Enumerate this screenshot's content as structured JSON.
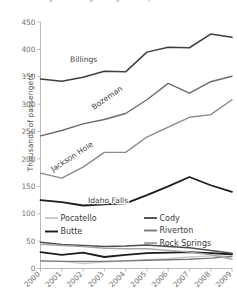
{
  "chart_data": {
    "type": "line",
    "title": "Passenger boardings at regional airports",
    "xlabel": "",
    "ylabel": "Thousands of passengers",
    "ylim": [
      0,
      450
    ],
    "ytick_labels": [
      "0",
      "50",
      "100",
      "150",
      "200",
      "250",
      "300",
      "350",
      "400",
      "450"
    ],
    "ytick_values": [
      0,
      50,
      100,
      150,
      200,
      250,
      300,
      350,
      400,
      450
    ],
    "grid": false,
    "legend_position": "inside-lower-left",
    "categories": [
      "2000",
      "2001",
      "2002",
      "2003",
      "2004",
      "2005",
      "2006",
      "2007",
      "2008",
      "2009"
    ],
    "x": [
      2000,
      2001,
      2002,
      2003,
      2004,
      2005,
      2006,
      2007,
      2008,
      2009
    ],
    "series": [
      {
        "name": "Billings",
        "color": "#3f3f3f",
        "width": 1.5,
        "label_mode": "inline",
        "values": [
          346,
          342,
          349,
          360,
          359,
          395,
          404,
          403,
          428,
          422
        ]
      },
      {
        "name": "Bozeman",
        "color": "#6b6b6b",
        "width": 1.4,
        "label_mode": "inline",
        "values": [
          242,
          252,
          264,
          272,
          283,
          308,
          338,
          320,
          341,
          351
        ]
      },
      {
        "name": "Jackson Hole",
        "color": "#8a8a8a",
        "width": 1.4,
        "label_mode": "inline",
        "values": [
          174,
          165,
          185,
          212,
          212,
          240,
          258,
          276,
          281,
          308
        ]
      },
      {
        "name": "Idaho Falls",
        "color": "#1c1c1c",
        "width": 1.8,
        "label_mode": "inline",
        "values": [
          125,
          121,
          115,
          117,
          119,
          134,
          150,
          167,
          152,
          140
        ]
      },
      {
        "name": "Pocatello",
        "color": "#c9c9c9",
        "width": 1.4,
        "label_mode": "legend",
        "values": [
          13,
          13,
          9,
          12,
          14,
          16,
          18,
          21,
          23,
          26
        ]
      },
      {
        "name": "Butte",
        "color": "#1c1c1c",
        "width": 1.8,
        "label_mode": "legend",
        "values": [
          30,
          25,
          29,
          21,
          25,
          28,
          29,
          30,
          28,
          26
        ]
      },
      {
        "name": "Cody",
        "color": "#4f4f4f",
        "width": 1.5,
        "label_mode": "legend",
        "values": [
          48,
          44,
          42,
          40,
          41,
          43,
          40,
          38,
          33,
          28
        ]
      },
      {
        "name": "Riverton",
        "color": "#7a7a7a",
        "width": 1.4,
        "label_mode": "legend",
        "values": [
          14,
          13,
          13,
          13,
          14,
          15,
          16,
          17,
          19,
          22
        ]
      },
      {
        "name": "Rock Springs",
        "color": "#a5a5a5",
        "width": 1.4,
        "label_mode": "legend",
        "values": [
          44,
          42,
          40,
          37,
          36,
          36,
          33,
          30,
          25,
          17
        ]
      }
    ],
    "inline_annotations": [
      {
        "text": "Billings",
        "x": 70,
        "y": 62,
        "rotate": 0
      },
      {
        "text": "Bozeman",
        "x": 94,
        "y": 110,
        "rotate": -35
      },
      {
        "text": "Jackson Hole",
        "x": 53,
        "y": 172,
        "rotate": -33
      },
      {
        "text": "Idaho Falls",
        "x": 88,
        "y": 203,
        "rotate": 0
      }
    ],
    "legend_entries_left": [
      "Pocatello",
      "Butte"
    ],
    "legend_entries_right": [
      "Cody",
      "Riverton",
      "Rock Springs"
    ]
  }
}
